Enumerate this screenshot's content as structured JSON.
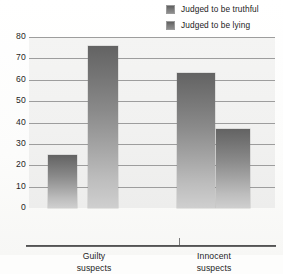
{
  "chart_data": {
    "type": "bar",
    "title": "",
    "subtitle": "",
    "xlabel": "",
    "ylabel": "",
    "categories": [
      "Guilty suspects",
      "Innocent suspects"
    ],
    "category_lines": [
      [
        "Guilty",
        "suspects"
      ],
      [
        "Innocent",
        "suspects"
      ]
    ],
    "series": [
      {
        "name": "Judged to be truthful",
        "values": [
          25,
          63
        ]
      },
      {
        "name": "Judged to be lying",
        "values": [
          76,
          37
        ]
      }
    ],
    "ylim": [
      0,
      80
    ],
    "ytick_values": [
      80,
      70,
      60,
      50,
      40,
      30,
      20,
      10,
      0
    ],
    "ytick_labels": [
      "80",
      "70",
      "60",
      "50",
      "40",
      "30",
      "20",
      "10",
      "0"
    ],
    "grid": true,
    "grid_axis": "y",
    "legend_position": "top-right",
    "bar_fill": "vertical-gradient-gray",
    "colors": {
      "bar_top": "#636363",
      "bar_bottom": "#cfcfcf",
      "gridline": "#9d9d9d",
      "plot_background": "#f1f1f0",
      "page_background": "#fdfdfc",
      "axis": "#4a4a4a",
      "text": "#1c1c1c"
    }
  },
  "legend": {
    "items": [
      {
        "label": "Judged to be truthful",
        "swatch": "legend-swatch-truthful"
      },
      {
        "label": "Judged to be lying",
        "swatch": "legend-swatch-lying"
      }
    ]
  }
}
